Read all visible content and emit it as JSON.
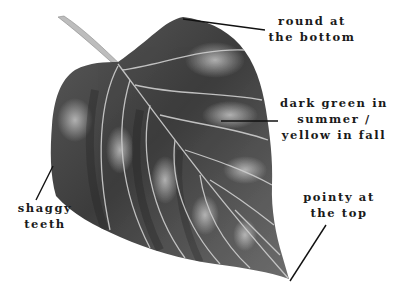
{
  "figure": {
    "style": "grayscale pencil drawing",
    "background": "#ffffff",
    "leaf_fill_dark": "#3a3a3a",
    "leaf_fill_mid": "#6b6b6b",
    "leaf_highlight": "#b5b5b5",
    "vein_color": "#c8c8c8",
    "line_color": "#111111"
  },
  "annotations": [
    {
      "id": "round",
      "lines": [
        "round at",
        "the bottom"
      ]
    },
    {
      "id": "color",
      "lines": [
        "dark green in",
        "summer /",
        "yellow in fall"
      ]
    },
    {
      "id": "teeth",
      "lines": [
        "shaggy",
        "teeth"
      ]
    },
    {
      "id": "tip",
      "lines": [
        "pointy at",
        "the top"
      ]
    }
  ]
}
